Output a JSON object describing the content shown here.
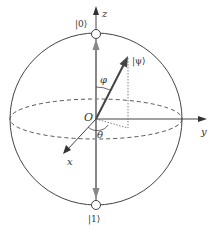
{
  "diagram": {
    "labels": {
      "z_axis": "z",
      "y_axis": "y",
      "x_axis": "x",
      "origin": "O",
      "state_zero": "|0⟩",
      "state_one": "|1⟩",
      "state_psi": "|ψ⟩",
      "polar_angle": "φ",
      "azimuthal_angle": "θ"
    },
    "colors": {
      "line": "#444444",
      "pole_arrow": "#888888",
      "dashed": "#555555",
      "dotted": "#666666"
    }
  }
}
